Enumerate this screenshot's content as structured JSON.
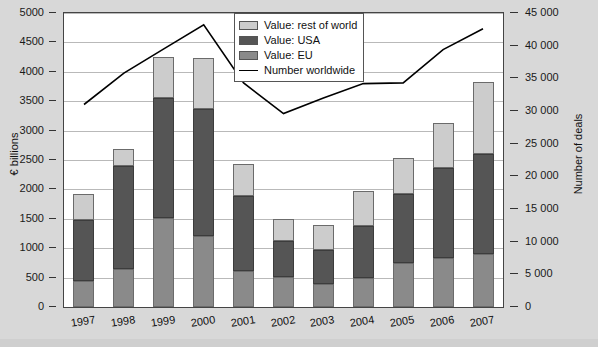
{
  "figure": {
    "title_fragment": "",
    "background_color": "#d8d8d8",
    "plot_background": "#ffffff"
  },
  "legend": {
    "position": "top-center-right",
    "entries": [
      {
        "label": "Value: rest of world",
        "marker": "swatch",
        "color": "#cccccc"
      },
      {
        "label": "Value: USA",
        "marker": "swatch",
        "color": "#555555"
      },
      {
        "label": "Value: EU",
        "marker": "swatch",
        "color": "#8a8a8a"
      },
      {
        "label": "Number worldwide",
        "marker": "line",
        "color": "#000000"
      }
    ]
  },
  "axes": {
    "left": {
      "title": "€ billions",
      "min": 0,
      "max": 5000,
      "step": 500,
      "ticks": [
        "0",
        "500",
        "1000",
        "1500",
        "2000",
        "2500",
        "3000",
        "3500",
        "4000",
        "4500",
        "5000"
      ]
    },
    "right": {
      "title": "Number of deals",
      "min": 0,
      "max": 45000,
      "step": 5000,
      "ticks": [
        "0",
        "5 000",
        "10 000",
        "15 000",
        "20 000",
        "25 000",
        "30 000",
        "35 000",
        "40 000",
        "45 000"
      ]
    },
    "x": {
      "title": "",
      "ticks": [
        "1997",
        "1998",
        "1999",
        "2000",
        "2001",
        "2002",
        "2003",
        "2004",
        "2005",
        "2006",
        "2007"
      ]
    }
  },
  "chart_data": {
    "type": "bar",
    "title": "",
    "xlabel": "",
    "ylabel": "€ billions",
    "y2label": "Number of deals",
    "ylim": [
      0,
      5000
    ],
    "y2lim": [
      0,
      45000
    ],
    "grid": true,
    "stacked": true,
    "legend_position": "upper center",
    "categories": [
      "1997",
      "1998",
      "1999",
      "2000",
      "2001",
      "2002",
      "2003",
      "2004",
      "2005",
      "2006",
      "2007"
    ],
    "series": [
      {
        "name": "Value: EU",
        "type": "bar",
        "color": "#8a8a8a",
        "axis": "left",
        "values": [
          450,
          640,
          1520,
          1210,
          620,
          510,
          390,
          500,
          740,
          840,
          900
        ]
      },
      {
        "name": "Value: USA",
        "type": "bar",
        "color": "#555555",
        "axis": "left",
        "values": [
          1030,
          1760,
          2040,
          2150,
          1270,
          620,
          580,
          880,
          1190,
          1530,
          1700
        ]
      },
      {
        "name": "Value: rest of world",
        "type": "bar",
        "color": "#cccccc",
        "axis": "left",
        "values": [
          450,
          290,
          690,
          875,
          545,
          370,
          420,
          590,
          610,
          755,
          1220
        ]
      },
      {
        "name": "Number worldwide",
        "type": "line",
        "color": "#000000",
        "axis": "right",
        "values": [
          31000,
          35800,
          39500,
          43200,
          34300,
          29600,
          32000,
          34200,
          34300,
          39400,
          42600
        ]
      }
    ],
    "stack_totals": [
      1930,
      2690,
      4250,
      4235,
      2435,
      1500,
      1390,
      1970,
      2540,
      3125,
      3820
    ]
  }
}
